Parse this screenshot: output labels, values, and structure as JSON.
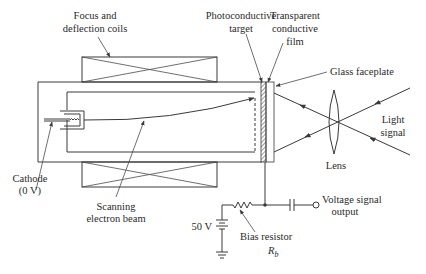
{
  "diagram": {
    "colors": {
      "line": "#3a3a3a",
      "text": "#2a2a2a",
      "background": "#ffffff"
    },
    "labels": {
      "focus_coils": [
        "Focus and",
        "deflection coils"
      ],
      "photoconductive_target": [
        "Photoconductive",
        "target"
      ],
      "transparent_film": [
        "Transparent",
        "conductive",
        "film"
      ],
      "glass_faceplate": "Glass faceplate",
      "light_signal": [
        "Light",
        "signal"
      ],
      "lens": "Lens",
      "cathode": [
        "Cathode",
        "(0 V)"
      ],
      "scanning_beam": [
        "Scanning",
        "electron beam"
      ],
      "battery_voltage": "50 V",
      "bias_resistor": "Bias resistor",
      "bias_resistor_symbol": "R",
      "bias_resistor_subscript": "b",
      "voltage_output": [
        "Voltage signal",
        "output"
      ]
    }
  }
}
